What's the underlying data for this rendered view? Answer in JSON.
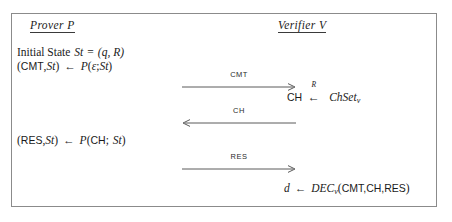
{
  "diagram": {
    "type": "protocol-flow",
    "title_visible": false,
    "border_color": "#8b8b8b",
    "background": "#ffffff",
    "text_color": "#1a1a1a"
  },
  "parties": {
    "left": {
      "heading": "Prover P",
      "name": "Prover",
      "symbol": "P"
    },
    "right": {
      "heading": "Verifier V",
      "name": "Verifier",
      "symbol": "V"
    }
  },
  "prover_steps": [
    {
      "id": "initial-state",
      "text": "Initial State St = (q, R)",
      "parts": {
        "label": "Initial State",
        "variable": "St",
        "equals": "=",
        "value": "(q, R)"
      }
    },
    {
      "id": "commit",
      "text": "(CMT,St) ← P(ε; St)",
      "parts": {
        "output_left": "(",
        "output_msg": "CMT",
        "comma": ",",
        "output_state": "St",
        "output_right": ")",
        "arrow": "←",
        "func": "P",
        "open": "(",
        "input": "ε",
        "semicolon": ";",
        "state": "St",
        "close": ")"
      }
    },
    {
      "id": "response",
      "text": "(RES,St) ← P(CH; St)",
      "parts": {
        "output_left": "(",
        "output_msg": "RES",
        "comma": ",",
        "output_state": "St",
        "output_right": ")",
        "arrow": "←",
        "func": "P",
        "open": "(",
        "input": "CH",
        "semicolon": ";",
        "state": "St",
        "close": ")"
      }
    }
  ],
  "verifier_steps": [
    {
      "id": "challenge-sampling",
      "text": "CH ←R ChSet_v",
      "parts": {
        "variable": "CH",
        "arrow_glyph": "←",
        "arrow_label": "R",
        "set": "ChSet",
        "set_subscript": "v"
      }
    },
    {
      "id": "decision",
      "text": "d ← DEC_v(CMT,CH,RES)",
      "parts": {
        "output": "d",
        "arrow": "←",
        "func": "DEC",
        "func_subscript": "v",
        "open": "(",
        "arg1": "CMT",
        "comma1": ",",
        "arg2": "CH",
        "comma2": ",",
        "arg3": "RES",
        "close": ")"
      }
    }
  ],
  "messages": [
    {
      "id": "cmt",
      "label": "CMT",
      "direction": "left-to-right",
      "from": "Prover",
      "to": "Verifier"
    },
    {
      "id": "ch",
      "label": "CH",
      "direction": "right-to-left",
      "from": "Verifier",
      "to": "Prover"
    },
    {
      "id": "res",
      "label": "RES",
      "direction": "left-to-right",
      "from": "Prover",
      "to": "Verifier"
    }
  ]
}
